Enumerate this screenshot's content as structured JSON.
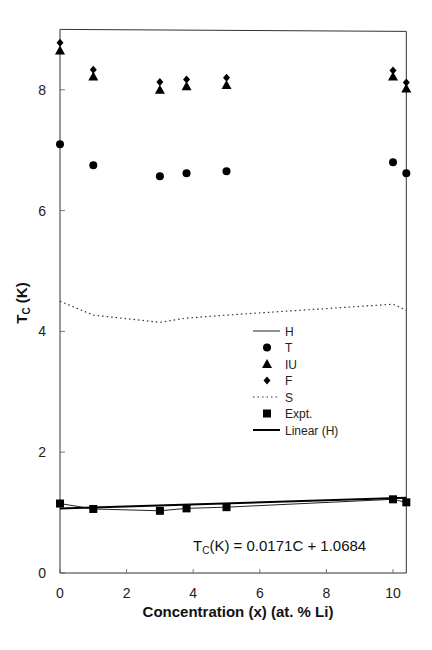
{
  "chart_data": {
    "type": "scatter",
    "title": "",
    "xlabel": "Concentration (x) (at. % Li)",
    "ylabel": "T_C (K)",
    "ylabel_main": "T",
    "ylabel_sub": "C",
    "ylabel_tail": " (K)",
    "xlim": [
      0,
      10.4
    ],
    "ylim": [
      0,
      9
    ],
    "x_ticks": [
      0,
      2,
      4,
      6,
      8,
      10
    ],
    "y_ticks": [
      0,
      2,
      4,
      6,
      8
    ],
    "grid": false,
    "legend_position": "inside-right",
    "x": [
      0,
      1,
      3,
      3.8,
      5,
      10,
      10.4
    ],
    "series": [
      {
        "name": "H",
        "style": "line-solid",
        "values": [
          1.15,
          1.06,
          1.03,
          1.07,
          1.09,
          1.22,
          1.17
        ]
      },
      {
        "name": "T",
        "style": "marker-circle",
        "values": [
          7.1,
          6.75,
          6.57,
          6.62,
          6.65,
          6.8,
          6.62
        ]
      },
      {
        "name": "IU",
        "style": "marker-triangle",
        "values": [
          8.65,
          8.22,
          8.0,
          8.06,
          8.08,
          8.22,
          8.02
        ]
      },
      {
        "name": "F",
        "style": "marker-diamond",
        "values": [
          8.78,
          8.33,
          8.13,
          8.17,
          8.2,
          8.32,
          8.12
        ]
      },
      {
        "name": "S",
        "style": "line-dotted",
        "values": [
          4.5,
          4.27,
          4.15,
          4.22,
          4.27,
          4.45,
          4.35
        ]
      },
      {
        "name": "Expt.",
        "style": "marker-square",
        "values": [
          1.15,
          1.06,
          1.03,
          1.07,
          1.09,
          1.22,
          1.17
        ]
      },
      {
        "name": "Linear (H)",
        "style": "line-solid-thick",
        "slope": 0.0171,
        "intercept": 1.0684
      }
    ],
    "annotations": [
      {
        "text_main": "T",
        "text_sub": "C",
        "text_tail": "(K) = 0.0171C + 1.0684",
        "text": "T_C(K) = 0.0171C + 1.0684",
        "x": 6.3,
        "y": 0.45
      }
    ]
  }
}
